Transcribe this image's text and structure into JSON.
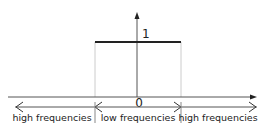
{
  "diagram": {
    "type": "ideal-low-pass-filter",
    "value_label": "1",
    "origin_label": "0",
    "regions": [
      {
        "label": "high frequencies"
      },
      {
        "label": "low frequencies"
      },
      {
        "label": "high frequencies"
      }
    ],
    "colors": {
      "axis": "#444444",
      "filter_line": "#222222",
      "guide": "#cccccc",
      "text": "#222222"
    }
  }
}
